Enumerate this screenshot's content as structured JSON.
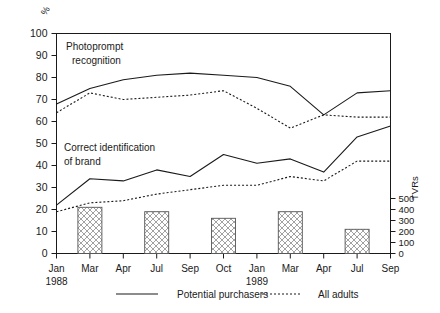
{
  "chart_data": {
    "type": "line",
    "title": "",
    "xlabel": "",
    "ylabel": "%",
    "ylabel_right": "TVRs",
    "ylim": [
      0,
      100
    ],
    "ylim_right": [
      0,
      550
    ],
    "grid": false,
    "legend_position": "bottom",
    "categories": [
      "Jan",
      "Mar",
      "Apr",
      "Jul",
      "Sep",
      "Oct",
      "Jan",
      "Mar",
      "Apr",
      "Jul",
      "Sep"
    ],
    "category_sublabels": [
      "1988",
      "",
      "",
      "",
      "",
      "",
      "1989",
      "",
      "",
      "",
      ""
    ],
    "yticks": [
      0,
      10,
      20,
      30,
      40,
      50,
      60,
      70,
      80,
      90,
      100
    ],
    "yticks_right": [
      0,
      100,
      200,
      300,
      400,
      500
    ],
    "annotations": [
      {
        "text_line1": "Photoprompt",
        "text_line2": "recognition"
      },
      {
        "text_line1": "Correct identification",
        "text_line2": "of brand"
      }
    ],
    "series": [
      {
        "name": "Photoprompt recognition — Potential purchasers",
        "style": "solid",
        "values": [
          68,
          75,
          79,
          81,
          82,
          81,
          80,
          76,
          63,
          73,
          74
        ]
      },
      {
        "name": "Photoprompt recognition — All adults",
        "style": "dotted",
        "values": [
          64,
          73,
          70,
          71,
          72,
          74,
          66,
          57,
          63,
          62,
          62
        ]
      },
      {
        "name": "Correct identification of brand — Potential purchasers",
        "style": "solid",
        "values": [
          22,
          34,
          33,
          38,
          35,
          45,
          41,
          43,
          37,
          53,
          58
        ]
      },
      {
        "name": "Correct identification of brand — All adults",
        "style": "dotted",
        "values": [
          19,
          23,
          24,
          27,
          29,
          31,
          31,
          35,
          33,
          42,
          42
        ]
      }
    ],
    "bars": {
      "name": "TVRs",
      "unit": "TVRs",
      "fill": "#ffffff",
      "hatch": "crosshatch",
      "points": [
        {
          "category_index": 1,
          "percent_height": 21,
          "tvr": 420
        },
        {
          "category_index": 3,
          "percent_height": 19,
          "tvr": 380
        },
        {
          "category_index": 5,
          "percent_height": 16,
          "tvr": 320
        },
        {
          "category_index": 7,
          "percent_height": 19,
          "tvr": 380
        },
        {
          "category_index": 9,
          "percent_height": 11,
          "tvr": 220
        }
      ]
    },
    "legend": [
      {
        "label": "Potential purchasers",
        "style": "solid"
      },
      {
        "label": "All adults",
        "style": "dotted"
      }
    ]
  }
}
